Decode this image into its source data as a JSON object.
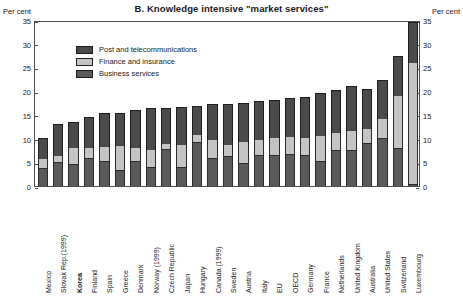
{
  "chart_data": {
    "type": "bar",
    "subtype": "stacked-column",
    "title": "B.  Knowledge intensive \"market services\"",
    "xlabel": "",
    "ylabel": "Per cent",
    "ylabel_right": "Per cent",
    "ylim": [
      0,
      35
    ],
    "yticks": [
      0,
      5,
      10,
      15,
      20,
      25,
      30,
      35
    ],
    "grid": false,
    "legend_position": "top-left-inside",
    "highlighted_category": "Korea",
    "categories": [
      "Mexico",
      "Slovak Rep.(1999)",
      "Korea",
      "Finland",
      "Spain",
      "Greece",
      "Denmark",
      "Norway (1999)",
      "Czech Republic",
      "Japan",
      "Hungary",
      "Canada (1999)",
      "Sweden",
      "Austria",
      "Italy",
      "EU",
      "OECD",
      "Germany",
      "France",
      "Netherlands",
      "United Kingdom",
      "Australia",
      "United States",
      "Switzerland",
      "Luxembourg"
    ],
    "series": [
      {
        "name": "Business services",
        "color": "#5a5a5a",
        "values": [
          3.8,
          5.0,
          4.7,
          6.0,
          5.3,
          3.3,
          5.3,
          4.0,
          7.9,
          4.0,
          9.3,
          6.0,
          6.3,
          4.8,
          6.5,
          6.6,
          6.7,
          6.6,
          5.2,
          7.5,
          7.6,
          9.0,
          10.2,
          8.0,
          0.4
        ]
      },
      {
        "name": "Finance and insurance",
        "color": "#c4c4c4",
        "values": [
          2.0,
          1.4,
          3.3,
          2.0,
          3.0,
          5.2,
          2.7,
          3.5,
          1.0,
          4.6,
          1.5,
          3.7,
          2.4,
          4.5,
          3.2,
          3.5,
          3.6,
          3.5,
          5.3,
          3.6,
          4.0,
          3.0,
          4.0,
          11.0,
          25.6
        ]
      },
      {
        "name": "Post and telecommunications",
        "color": "#4a4a4a",
        "values": [
          4.4,
          6.6,
          5.4,
          6.5,
          7.2,
          7.0,
          8.0,
          9.0,
          7.6,
          8.0,
          6.0,
          7.6,
          8.6,
          8.2,
          8.3,
          8.1,
          8.3,
          8.6,
          9.1,
          9.1,
          9.4,
          8.5,
          8.1,
          8.5,
          8.5
        ]
      }
    ],
    "totals": [
      10.2,
      13.0,
      13.4,
      14.5,
      15.5,
      15.5,
      16.0,
      16.5,
      16.5,
      16.6,
      16.8,
      17.3,
      17.3,
      17.5,
      18.0,
      18.2,
      18.6,
      18.7,
      19.6,
      20.2,
      21.0,
      20.5,
      22.3,
      27.5,
      34.5
    ]
  },
  "axis": {
    "unit_left": "Per cent",
    "unit_right": "Per cent",
    "tick_labels": [
      "35",
      "30",
      "25",
      "20",
      "15",
      "10",
      "5",
      "0"
    ]
  },
  "legend": {
    "items": [
      {
        "label": "Post and telecommunications",
        "key": "post"
      },
      {
        "label": "Finance and insurance",
        "key": "finance"
      },
      {
        "label": "Business services",
        "key": "business"
      }
    ]
  }
}
